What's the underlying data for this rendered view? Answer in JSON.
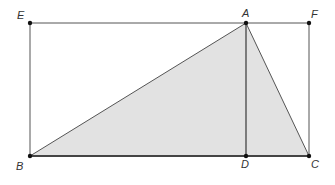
{
  "diagram": {
    "title": "",
    "colors": {
      "line": "#555555",
      "base_line": "#444444",
      "fill": "#e2e2e2",
      "point": "#111111",
      "label": "#333333"
    },
    "points": {
      "E": {
        "label": "E",
        "x": 30,
        "y": 23
      },
      "A": {
        "label": "A",
        "x": 246,
        "y": 23
      },
      "F": {
        "label": "F",
        "x": 309,
        "y": 23
      },
      "B": {
        "label": "B",
        "x": 30,
        "y": 156
      },
      "D": {
        "label": "D",
        "x": 246,
        "y": 156
      },
      "C": {
        "label": "C",
        "x": 309,
        "y": 156
      }
    },
    "shaded_region": "triangle ABC",
    "segments": [
      "EF",
      "FC",
      "CB",
      "BE",
      "AB",
      "AC",
      "AD"
    ]
  }
}
